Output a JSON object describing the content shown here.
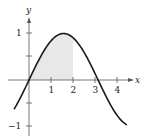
{
  "chart_data": {
    "type": "line",
    "title": "",
    "function": "y = sin(x)",
    "xlabel": "x",
    "ylabel": "y",
    "xlim": [
      -0.7,
      4.5
    ],
    "ylim": [
      -1.15,
      1.3
    ],
    "x_ticks": [
      1,
      2,
      3,
      4
    ],
    "x_tick_labels": [
      "1",
      "2",
      "3",
      "4"
    ],
    "y_ticks": [
      -1,
      -0.5,
      0.5,
      1
    ],
    "y_tick_labels": [
      "-1",
      "",
      "",
      "1"
    ],
    "grid": false,
    "legend": null,
    "shaded_region": {
      "from_x": 0,
      "to_x": 2,
      "color": "#e8e8e8"
    },
    "series": [
      {
        "name": "sin(x)",
        "x": [
          -0.68,
          0,
          0.5,
          1,
          1.5708,
          2,
          2.5,
          3,
          3.1416,
          3.5,
          4,
          4.45
        ],
        "y": [
          -0.63,
          0,
          0.479,
          0.841,
          1,
          0.909,
          0.598,
          0.141,
          0,
          -0.351,
          -0.757,
          -0.965
        ]
      }
    ]
  },
  "labels": {
    "x_axis": "x",
    "y_axis": "y",
    "x1": "1",
    "x2": "2",
    "x3": "3",
    "x4": "4",
    "y1": "1",
    "ym1": "−1"
  }
}
